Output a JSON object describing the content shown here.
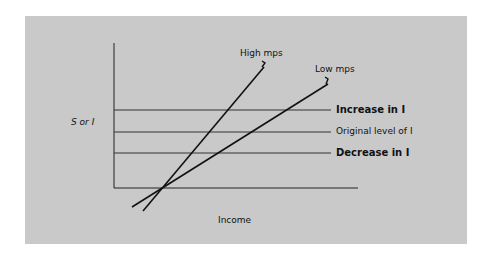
{
  "diagram": {
    "type": "line",
    "y_axis_label": "S or I",
    "x_axis_label": "Income",
    "lines": [
      {
        "name": "High mps",
        "label": "High mps"
      },
      {
        "name": "Low mps",
        "label": "Low mps"
      }
    ],
    "levels": [
      {
        "label": "Increase in I",
        "emphasis": "bold"
      },
      {
        "label": "Original level of I",
        "emphasis": "normal"
      },
      {
        "label": "Decrease in I",
        "emphasis": "bold"
      }
    ],
    "colors": {
      "background": "#c9c9c9",
      "line": "#111111",
      "page": "#ffffff"
    }
  }
}
